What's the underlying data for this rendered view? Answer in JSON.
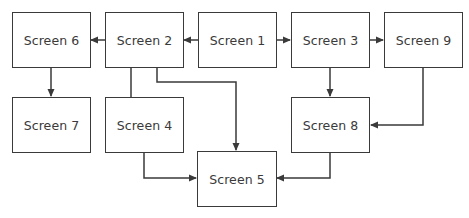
{
  "diagram": {
    "type": "flowchart",
    "colors": {
      "stroke": "#3a3a3a",
      "text": "#3a3a3a",
      "background": "#ffffff"
    },
    "nodes": [
      {
        "id": "screen1",
        "label": "Screen 1"
      },
      {
        "id": "screen2",
        "label": "Screen 2"
      },
      {
        "id": "screen3",
        "label": "Screen 3"
      },
      {
        "id": "screen4",
        "label": "Screen 4"
      },
      {
        "id": "screen5",
        "label": "Screen 5"
      },
      {
        "id": "screen6",
        "label": "Screen 6"
      },
      {
        "id": "screen7",
        "label": "Screen 7"
      },
      {
        "id": "screen8",
        "label": "Screen 8"
      },
      {
        "id": "screen9",
        "label": "Screen 9"
      }
    ],
    "edges": [
      {
        "from": "screen1",
        "to": "screen2",
        "arrow": true
      },
      {
        "from": "screen1",
        "to": "screen3",
        "arrow": true
      },
      {
        "from": "screen2",
        "to": "screen6",
        "arrow": true
      },
      {
        "from": "screen2",
        "to": "screen4",
        "arrow": false
      },
      {
        "from": "screen2",
        "to": "screen5",
        "arrow": true
      },
      {
        "from": "screen6",
        "to": "screen7",
        "arrow": true
      },
      {
        "from": "screen3",
        "to": "screen9",
        "arrow": true
      },
      {
        "from": "screen3",
        "to": "screen8",
        "arrow": true
      },
      {
        "from": "screen9",
        "to": "screen8",
        "arrow": true
      },
      {
        "from": "screen4",
        "to": "screen5",
        "arrow": true
      },
      {
        "from": "screen8",
        "to": "screen5",
        "arrow": true
      }
    ]
  }
}
